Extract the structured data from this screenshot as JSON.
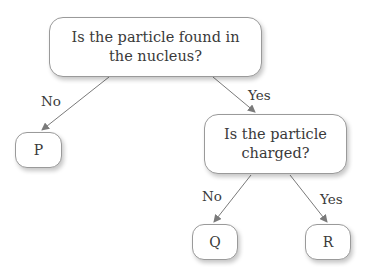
{
  "diagram": {
    "type": "decision-tree",
    "root": {
      "question": "Is the particle found in the nucleus?",
      "line1": "Is the particle found in",
      "line2": "the nucleus?"
    },
    "branches": {
      "root_no": "No",
      "root_yes": "Yes",
      "second_no": "No",
      "second_yes": "Yes"
    },
    "second": {
      "question": "Is the particle charged?",
      "line1": "Is the particle",
      "line2": "charged?"
    },
    "leaves": {
      "p": "P",
      "q": "Q",
      "r": "R"
    },
    "colors": {
      "edge": "#7a7a7a",
      "border": "#9a9a9a",
      "text": "#3a3a3a"
    }
  }
}
